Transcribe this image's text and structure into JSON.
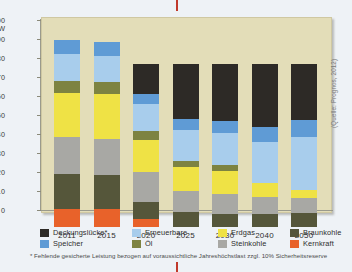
{
  "chart_data": {
    "type": "bar",
    "title": "",
    "subtitle": "",
    "xlabel": "",
    "ylabel": "GW",
    "ylim": [
      0,
      100
    ],
    "yticks": [
      0,
      10,
      20,
      30,
      40,
      50,
      60,
      70,
      80,
      90,
      100
    ],
    "grid": false,
    "stacked": true,
    "legend_position": "bottom",
    "unit": "GW",
    "categories": [
      "2011",
      "2015",
      "2020",
      "2025",
      "2030",
      "2040",
      "2050"
    ],
    "series": [
      {
        "name": "Kernkraft",
        "color": "#e8622a",
        "values": [
          9.5,
          9.5,
          4.0,
          0,
          0,
          0,
          0
        ]
      },
      {
        "name": "Braunkohle",
        "color": "#55563a",
        "values": [
          18.5,
          18.0,
          9.0,
          8.0,
          7.0,
          7.0,
          7.5
        ]
      },
      {
        "name": "Steinkohle",
        "color": "#a8a8a4",
        "values": [
          19.5,
          19.0,
          16.0,
          11.0,
          10.5,
          9.0,
          8.0
        ]
      },
      {
        "name": "Erdgas",
        "color": "#efe245",
        "values": [
          23.0,
          23.5,
          17.0,
          12.5,
          12.0,
          7.0,
          4.0
        ]
      },
      {
        "name": "Öl",
        "color": "#7d8341",
        "values": [
          6.5,
          6.5,
          4.5,
          3.0,
          3.0,
          0,
          0
        ]
      },
      {
        "name": "Erneuerbare",
        "color": "#a8cdec",
        "values": [
          14.0,
          13.5,
          14.5,
          16.5,
          17.0,
          21.5,
          28.0
        ]
      },
      {
        "name": "Speicher",
        "color": "#5f9bd5",
        "values": [
          7.5,
          7.5,
          5.0,
          6.0,
          6.5,
          8.0,
          9.0
        ]
      },
      {
        "name": "Deckungslücke*",
        "color": "#2d2a26",
        "values": [
          0,
          0,
          16.0,
          29.0,
          30.0,
          33.5,
          29.5
        ]
      }
    ],
    "series_order_bottom_to_top": [
      "Kernkraft",
      "Braunkohle",
      "Steinkohle",
      "Erdgas",
      "Öl",
      "Erneuerbare",
      "Speicher",
      "Deckungslücke*"
    ],
    "annotations": [
      "(Quelle: Prognos, 2012)"
    ],
    "footnote": "* Fehlende gesicherte Leistung bezogen auf voraussichtliche Jahreshöchstlast zzgl. 10% Sicherheitsreserve"
  },
  "axis": {
    "unit_label": "GW",
    "tick_labels": [
      "100",
      "90",
      "80",
      "70",
      "60",
      "50",
      "40",
      "30",
      "20",
      "10",
      "0"
    ]
  },
  "legend": {
    "items": [
      {
        "label": "Deckungslücke*",
        "color": "#2d2a26"
      },
      {
        "label": "Erneuerbare",
        "color": "#a8cdec"
      },
      {
        "label": "Erdgas",
        "color": "#efe245"
      },
      {
        "label": "Braunkohle",
        "color": "#55563a"
      },
      {
        "label": "Speicher",
        "color": "#5f9bd5"
      },
      {
        "label": "Öl",
        "color": "#7d8341"
      },
      {
        "label": "Steinkohle",
        "color": "#a8a8a4"
      },
      {
        "label": "Kernkraft",
        "color": "#e8622a"
      }
    ]
  },
  "source": "(Quelle: Prognos, 2012)",
  "footnote": "* Fehlende gesicherte Leistung bezogen auf voraussichtliche Jahreshöchstlast zzgl. 10% Sicherheitsreserve",
  "colors": {
    "panel_background": "#e3ddb8",
    "page_background": "#eef2f6",
    "tick_mark": "#c0392b"
  }
}
